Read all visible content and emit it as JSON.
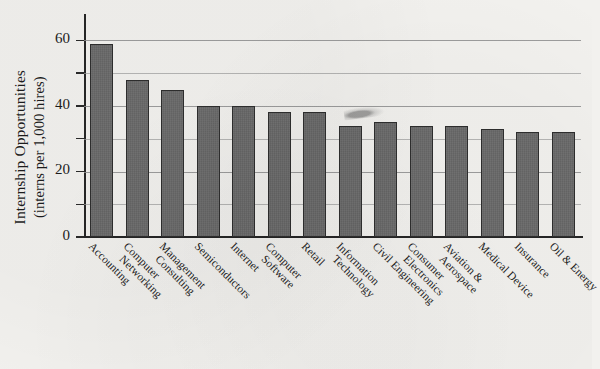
{
  "chart_data": {
    "type": "bar",
    "title": "",
    "xlabel": "",
    "ylabel_line1": "Internship Opportunities",
    "ylabel_line2": "(interns per 1,000 hires)",
    "ylim": [
      0,
      65
    ],
    "yticks": [
      0,
      20,
      40,
      60
    ],
    "ytick_labels": [
      "0",
      "20",
      "40",
      "60"
    ],
    "minor_gridlines": [
      10,
      30,
      50
    ],
    "grid": true,
    "legend": "none",
    "bar_color": "#6a6a6a",
    "bar_edge_color": "#2e2e2e",
    "background_color": "#f2f1ee",
    "categories": [
      "Accounting",
      "Computer Networking",
      "Management Consulting",
      "Semiconductors",
      "Internet",
      "Computer Software",
      "Retail",
      "Information Technology",
      "Civil Engineering",
      "Consumer Electronics",
      "Aviation & Aerospace",
      "Medical Device",
      "Insurance",
      "Oil & Energy"
    ],
    "category_lines": [
      [
        "Accounting"
      ],
      [
        "Computer",
        "Networking"
      ],
      [
        "Management",
        "Consulting"
      ],
      [
        "Semiconductors"
      ],
      [
        "Internet"
      ],
      [
        "Computer",
        "Software"
      ],
      [
        "Retail"
      ],
      [
        "Information",
        "Technology"
      ],
      [
        "Civil Engineering"
      ],
      [
        "Consumer",
        "Electronics"
      ],
      [
        "Aviation &",
        "Aerospace"
      ],
      [
        "Medical Device"
      ],
      [
        "Insurance"
      ],
      [
        "Oil & Energy"
      ]
    ],
    "values": [
      59,
      48,
      45,
      40,
      40,
      38,
      38,
      34,
      35,
      34,
      34,
      33,
      32,
      32
    ]
  }
}
